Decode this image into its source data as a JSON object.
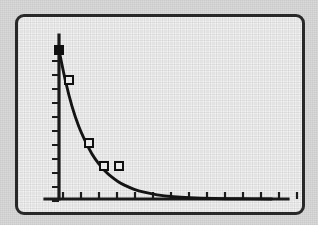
{
  "figure": {
    "frame": {
      "x": 15,
      "y": 14,
      "width": 290,
      "height": 201,
      "border_color": "#2a2a2a",
      "border_width": 3,
      "corner_radius": 9,
      "interior_color": "#f2f2f2"
    },
    "outer_background": "#d9d9d9",
    "ink_color": "#151515"
  },
  "chart_data": {
    "type": "line",
    "title": "",
    "subtitle": "",
    "xlabel": "",
    "ylabel": "",
    "grid": false,
    "legend": null,
    "axes": {
      "x_axis": {
        "pixel_y": 182,
        "pixel_x_start": 27,
        "pixel_x_end": 270,
        "tick_count": 14,
        "tick_direction": "up",
        "tick_length": 7,
        "tick_spacing_px": 18,
        "tick_first_px": 45,
        "tick_labels": [],
        "range": [
          0,
          14
        ]
      },
      "y_axis": {
        "pixel_x": 41,
        "pixel_y_top": 18,
        "pixel_y_bottom": 182,
        "tick_count": 11,
        "tick_direction": "left",
        "tick_length": 7,
        "tick_spacing_px": 14,
        "tick_first_px": 44,
        "tick_labels": [],
        "range": [
          0,
          1
        ]
      }
    },
    "series": [
      {
        "name": "fitted exponential decay curve",
        "style": "solid-line",
        "model": "y = A * exp(-k * x)",
        "x": [
          0.0,
          0.4,
          0.8,
          1.2,
          1.6,
          2.0,
          2.4,
          2.8,
          3.2,
          3.6,
          4.0,
          4.6,
          5.2,
          6.0,
          7.0,
          8.0,
          9.5,
          11.0,
          13.0
        ],
        "y": [
          1.0,
          0.79,
          0.62,
          0.49,
          0.39,
          0.305,
          0.24,
          0.19,
          0.15,
          0.118,
          0.093,
          0.065,
          0.046,
          0.028,
          0.015,
          0.008,
          0.003,
          0.0015,
          0.0
        ]
      },
      {
        "name": "observed data points",
        "style": "square-markers",
        "x": [
          0.0,
          0.55,
          1.65,
          2.5,
          3.3
        ],
        "y": [
          1.0,
          0.815,
          0.42,
          0.28,
          0.28
        ],
        "marker_fill": [
          "filled",
          "open",
          "open",
          "open",
          "open"
        ],
        "marker_size_px": 8,
        "pixels": [
          {
            "x": 41,
            "y": 33,
            "fill": "filled"
          },
          {
            "x": 51,
            "y": 63,
            "fill": "open"
          },
          {
            "x": 71,
            "y": 126,
            "fill": "open"
          },
          {
            "x": 86,
            "y": 149,
            "fill": "open"
          },
          {
            "x": 101,
            "y": 149,
            "fill": "open"
          }
        ]
      }
    ]
  }
}
